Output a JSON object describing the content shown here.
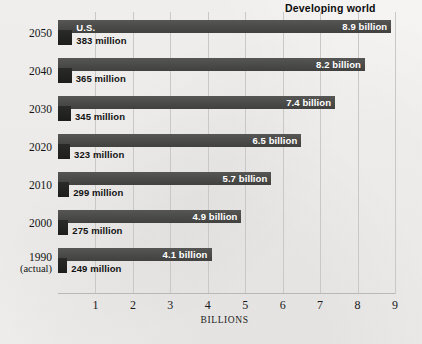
{
  "chart_data": {
    "type": "bar",
    "title": "Developing world",
    "xlabel": "BILLIONS",
    "ylabel": "",
    "orientation": "horizontal",
    "xlim": [
      0,
      9
    ],
    "grid": true,
    "legend_position": "inline-labels",
    "tick_labels": [
      "1",
      "2",
      "3",
      "4",
      "5",
      "6",
      "7",
      "8",
      "9"
    ],
    "tick_values": [
      1,
      2,
      3,
      4,
      5,
      6,
      7,
      8,
      9
    ],
    "categories": [
      "2050",
      "2040",
      "2030",
      "2020",
      "2010",
      "2000",
      "1990"
    ],
    "category_sublabels": [
      "",
      "",
      "",
      "",
      "",
      "",
      "(actual)"
    ],
    "series": [
      {
        "name": "Developing world",
        "unit": "billions",
        "values": [
          8.9,
          8.2,
          7.4,
          6.5,
          5.7,
          4.9,
          4.1
        ],
        "labels": [
          "8.9 billion",
          "8.2 billion",
          "7.4 billion",
          "6.5 billion",
          "5.7 billion",
          "4.9 billion",
          "4.1 billion"
        ],
        "color": "#4b4b49"
      },
      {
        "name": "U.S.",
        "unit": "millions",
        "values": [
          0.383,
          0.365,
          0.345,
          0.323,
          0.299,
          0.275,
          0.249
        ],
        "labels": [
          "383 million",
          "365 million",
          "345 million",
          "323 million",
          "299 million",
          "275 million",
          "249 million"
        ],
        "color": "#1d1d1c"
      }
    ],
    "annotations": [
      {
        "text": "U.S.",
        "row": 0
      }
    ]
  },
  "colors": {
    "background": "#f3f2f0",
    "gridline": "#c9c8c5",
    "developing_bar": "#4b4b49",
    "us_bar": "#1d1d1c",
    "text": "#141414",
    "inverse_text": "#ffffff"
  }
}
